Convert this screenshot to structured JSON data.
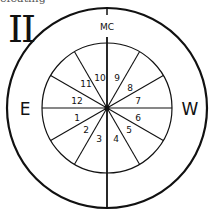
{
  "figure": {
    "cut_text": "efeating",
    "numeral": "II",
    "labels": {
      "top": "MC",
      "left": "E",
      "right": "W"
    },
    "houses": [
      "1",
      "2",
      "3",
      "4",
      "5",
      "6",
      "7",
      "8",
      "9",
      "10",
      "11",
      "12"
    ],
    "colors": {
      "stroke": "#111111",
      "background": "#ffffff"
    }
  }
}
